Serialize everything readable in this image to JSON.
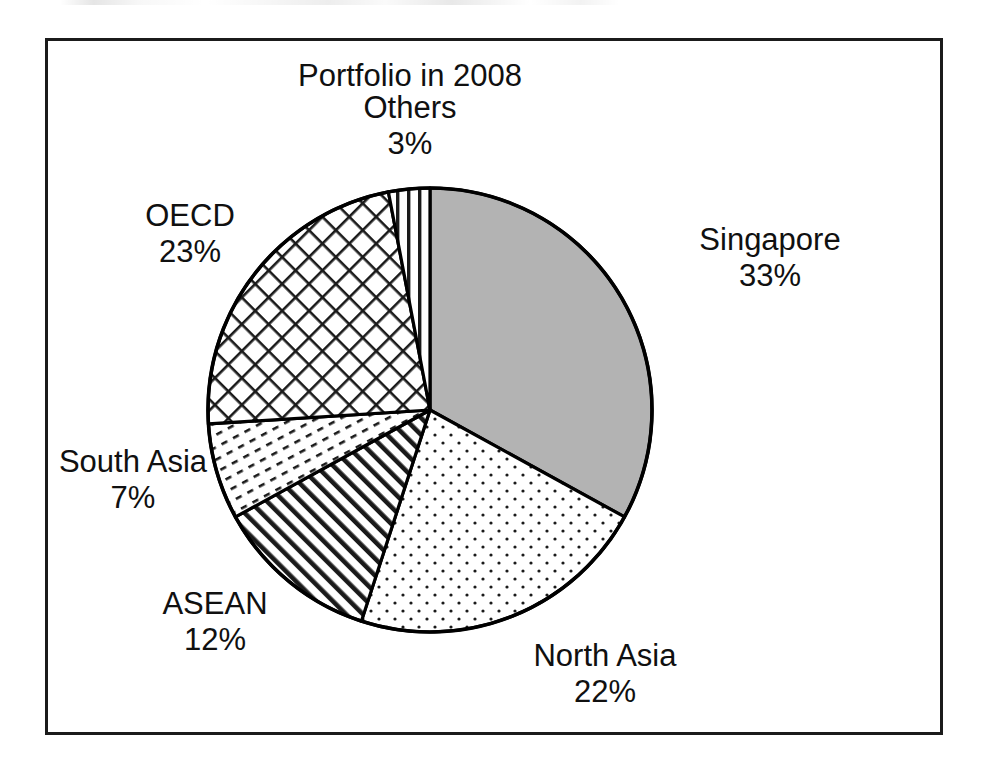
{
  "chart_data": {
    "type": "pie",
    "title": "Portfolio in 2008",
    "xlabel": "",
    "ylabel": "",
    "legend_position": "none",
    "grid": false,
    "units": "percent",
    "categories": [
      "Singapore",
      "North Asia",
      "ASEAN",
      "South Asia",
      "OECD",
      "Others"
    ],
    "values": [
      33,
      22,
      12,
      7,
      23,
      3
    ],
    "start_angle_deg": 0,
    "direction": "clockwise",
    "slices": [
      {
        "label": "Singapore",
        "value": 33,
        "value_label": "33%",
        "fill": "solid-gray",
        "fill_color": "#b3b3b3",
        "start_deg": 0,
        "end_deg": 118.8
      },
      {
        "label": "North Asia",
        "value": 22,
        "value_label": "22%",
        "fill": "dots",
        "fill_color": "#ffffff",
        "start_deg": 118.8,
        "end_deg": 198.0
      },
      {
        "label": "ASEAN",
        "value": 12,
        "value_label": "12%",
        "fill": "diagonal-hatch",
        "fill_color": "#ffffff",
        "start_deg": 198.0,
        "end_deg": 241.2
      },
      {
        "label": "South Asia",
        "value": 7,
        "value_label": "7%",
        "fill": "fine-diagonal-hatch",
        "fill_color": "#ffffff",
        "start_deg": 241.2,
        "end_deg": 266.4
      },
      {
        "label": "OECD",
        "value": 23,
        "value_label": "23%",
        "fill": "cross-hatch",
        "fill_color": "#ffffff",
        "start_deg": 266.4,
        "end_deg": 349.2
      },
      {
        "label": "Others",
        "value": 3,
        "value_label": "3%",
        "fill": "vertical-lines",
        "fill_color": "#ffffff",
        "start_deg": 349.2,
        "end_deg": 360.0
      }
    ]
  },
  "labels": {
    "title": "Portfolio in 2008",
    "others_name": "Others",
    "others_value": "3%",
    "singapore_name": "Singapore",
    "singapore_value": "33%",
    "northasia_name": "North Asia",
    "northasia_value": "22%",
    "asean_name": "ASEAN",
    "asean_value": "12%",
    "southasia_name": "South Asia",
    "southasia_value": "7%",
    "oecd_name": "OECD",
    "oecd_value": "23%"
  },
  "style": {
    "frame_color": "#1b1b1b",
    "outline_color": "#000000",
    "background": "#ffffff",
    "text_color": "#101010"
  }
}
